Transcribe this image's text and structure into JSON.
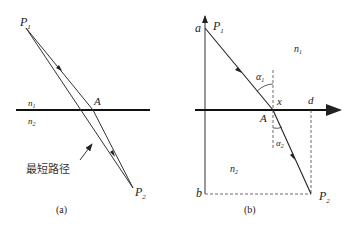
{
  "diagram": {
    "colors": {
      "line": "#222222",
      "background": "#ffffff"
    },
    "panel_a": {
      "caption": "(a)",
      "labels": {
        "P1": "P",
        "P1_sub": "1",
        "P2": "P",
        "P2_sub": "2",
        "A": "A",
        "n1": "n",
        "n1_sub": "1",
        "n2": "n",
        "n2_sub": "2",
        "shortest_path": "最短路径"
      }
    },
    "panel_b": {
      "caption": "(b)",
      "labels": {
        "P1": "P",
        "P1_sub": "1",
        "P2": "P",
        "P2_sub": "2",
        "A": "A",
        "a": "a",
        "b": "b",
        "d": "d",
        "x": "x",
        "n1": "n",
        "n1_sub": "1",
        "n2": "n",
        "n2_sub": "2",
        "alpha1": "α",
        "alpha1_sub": "1",
        "alpha2": "α",
        "alpha2_sub": "2"
      }
    }
  }
}
